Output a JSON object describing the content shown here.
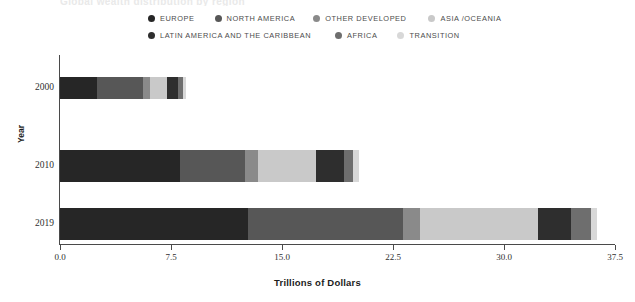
{
  "title_faint": "Global wealth distribution by region",
  "axis": {
    "x_title": "Trillions of Dollars",
    "y_title": "Year",
    "x_ticks": [
      "0.0",
      "7.5",
      "15.0",
      "22.5",
      "30.0",
      "37.5"
    ],
    "x_tick_values": [
      0,
      7.5,
      15,
      22.5,
      30,
      37.5
    ],
    "x_min": 0,
    "x_max": 37.5,
    "y_ticks": [
      "2000",
      "2010",
      "2019"
    ]
  },
  "legend": {
    "row1": [
      {
        "label": "EUROPE",
        "color": "#262626"
      },
      {
        "label": "NORTH AMERICA",
        "color": "#575757"
      },
      {
        "label": "OTHER DEVELOPED",
        "color": "#8a8a8a"
      },
      {
        "label": "ASIA /OCEANIA",
        "color": "#c9c9c9"
      }
    ],
    "row2": [
      {
        "label": "LATIN AMERICA AND THE CARIBBEAN",
        "color": "#2e2e2e"
      },
      {
        "label": "AFRICA",
        "color": "#6e6e6e"
      },
      {
        "label": "TRANSITION",
        "color": "#d8d8d8"
      }
    ]
  },
  "chart_data": {
    "type": "bar",
    "orientation": "horizontal",
    "stacked": true,
    "title": "",
    "xlabel": "Trillions of Dollars",
    "ylabel": "Year",
    "xlim": [
      0,
      37.5
    ],
    "grid": false,
    "legend_position": "top",
    "categories": [
      "2000",
      "2010",
      "2019"
    ],
    "series": [
      {
        "name": "EUROPE",
        "color": "#262626",
        "values": [
          2.5,
          8.1,
          12.7
        ]
      },
      {
        "name": "NORTH AMERICA",
        "color": "#575757",
        "values": [
          3.1,
          4.4,
          10.5
        ]
      },
      {
        "name": "OTHER DEVELOPED",
        "color": "#8a8a8a",
        "values": [
          0.5,
          0.9,
          1.1
        ]
      },
      {
        "name": "ASIA /OCEANIA",
        "color": "#c9c9c9",
        "values": [
          1.1,
          3.9,
          8.0
        ]
      },
      {
        "name": "LATIN AMERICA AND THE CARIBBEAN",
        "color": "#2e2e2e",
        "values": [
          0.8,
          1.9,
          2.2
        ]
      },
      {
        "name": "AFRICA",
        "color": "#6e6e6e",
        "values": [
          0.3,
          0.6,
          1.4
        ]
      },
      {
        "name": "TRANSITION",
        "color": "#d8d8d8",
        "values": [
          0.2,
          0.4,
          0.4
        ]
      }
    ],
    "totals": [
      8.5,
      20.2,
      36.3
    ]
  }
}
